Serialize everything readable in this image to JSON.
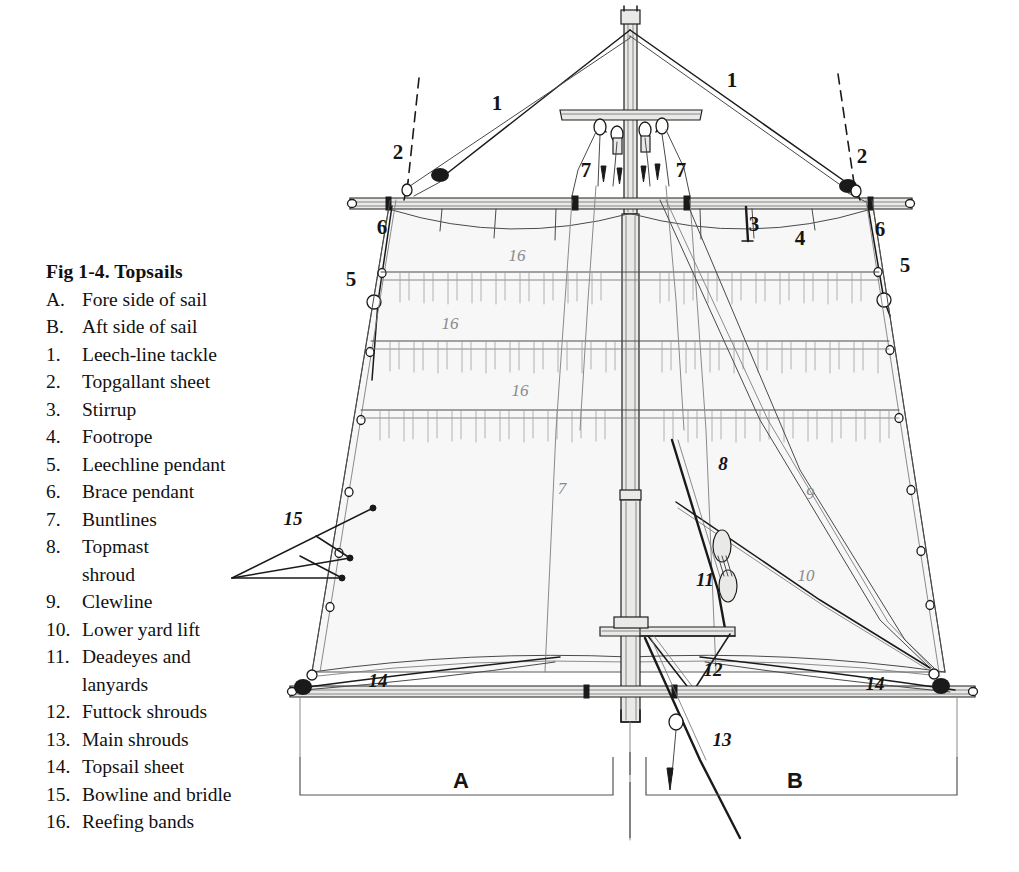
{
  "figure": {
    "title": "Fig 1-4. Topsails",
    "legend_items": [
      {
        "marker": "A.",
        "label": "Fore side of sail"
      },
      {
        "marker": "B.",
        "label": "Aft side of sail"
      },
      {
        "marker": "1.",
        "label": "Leech-line tackle"
      },
      {
        "marker": "2.",
        "label": "Topgallant sheet"
      },
      {
        "marker": "3.",
        "label": "Stirrup"
      },
      {
        "marker": "4.",
        "label": "Footrope"
      },
      {
        "marker": "5.",
        "label": "Leechline pendant"
      },
      {
        "marker": "6.",
        "label": "Brace pendant"
      },
      {
        "marker": "7.",
        "label": "Buntlines"
      },
      {
        "marker": "8.",
        "label": "Topmast"
      },
      {
        "marker": "",
        "label": "shroud",
        "continuation": true
      },
      {
        "marker": "9.",
        "label": "Clewline"
      },
      {
        "marker": "10.",
        "label": "Lower yard lift"
      },
      {
        "marker": "11.",
        "label": "Deadeyes and"
      },
      {
        "marker": "",
        "label": "lanyards",
        "continuation": true
      },
      {
        "marker": "12.",
        "label": "Futtock shrouds"
      },
      {
        "marker": "13.",
        "label": "Main shrouds"
      },
      {
        "marker": "14.",
        "label": "Topsail sheet"
      },
      {
        "marker": "15.",
        "label": "Bowline and bridle"
      },
      {
        "marker": "16.",
        "label": "Reefing bands"
      }
    ],
    "callouts": [
      {
        "text": "1",
        "x": 497,
        "y": 103,
        "style": "big"
      },
      {
        "text": "1",
        "x": 732,
        "y": 80,
        "style": "big"
      },
      {
        "text": "2",
        "x": 398,
        "y": 152,
        "style": "big"
      },
      {
        "text": "2",
        "x": 862,
        "y": 156,
        "style": "big"
      },
      {
        "text": "7",
        "x": 586,
        "y": 170,
        "style": "big"
      },
      {
        "text": "7",
        "x": 681,
        "y": 170,
        "style": "big"
      },
      {
        "text": "3",
        "x": 754,
        "y": 224,
        "style": "big"
      },
      {
        "text": "4",
        "x": 800,
        "y": 238,
        "style": "big"
      },
      {
        "text": "6",
        "x": 382,
        "y": 227,
        "style": "big"
      },
      {
        "text": "6",
        "x": 880,
        "y": 229,
        "style": "big"
      },
      {
        "text": "5",
        "x": 351,
        "y": 279,
        "style": "big"
      },
      {
        "text": "5",
        "x": 905,
        "y": 265,
        "style": "big"
      },
      {
        "text": "16",
        "x": 517,
        "y": 256,
        "style": "faint"
      },
      {
        "text": "16",
        "x": 450,
        "y": 324,
        "style": "faint"
      },
      {
        "text": "16",
        "x": 520,
        "y": 391,
        "style": "faint"
      },
      {
        "text": "7",
        "x": 562,
        "y": 489,
        "style": "faint"
      },
      {
        "text": "8",
        "x": 723,
        "y": 464,
        "style": "plain"
      },
      {
        "text": "9",
        "x": 810,
        "y": 494,
        "style": "faint"
      },
      {
        "text": "10",
        "x": 806,
        "y": 576,
        "style": "faint"
      },
      {
        "text": "11",
        "x": 705,
        "y": 580,
        "style": "plain"
      },
      {
        "text": "12",
        "x": 713,
        "y": 670,
        "style": "plain"
      },
      {
        "text": "13",
        "x": 722,
        "y": 740,
        "style": "plain"
      },
      {
        "text": "14",
        "x": 378,
        "y": 681,
        "style": "plain"
      },
      {
        "text": "14",
        "x": 875,
        "y": 684,
        "style": "plain"
      },
      {
        "text": "15",
        "x": 293,
        "y": 519,
        "style": "plain"
      },
      {
        "text": "A",
        "x": 461,
        "y": 781,
        "style": "section"
      },
      {
        "text": "B",
        "x": 795,
        "y": 781,
        "style": "section"
      }
    ],
    "colors": {
      "ink": "#1a1a1a",
      "light_ink": "#6f6f6f",
      "pencil": "#9a9a9a",
      "sail_fill": "#f7f7f7",
      "spar_fill": "#e8e8e6",
      "background": "#ffffff"
    }
  }
}
